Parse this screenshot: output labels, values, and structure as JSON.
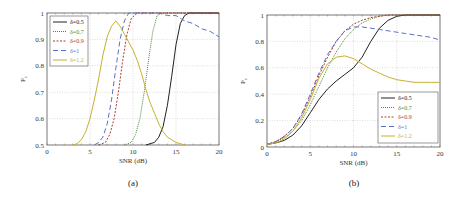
{
  "chart_data": [
    {
      "type": "line",
      "caption": "(a)",
      "xlabel": "SNR (dB)",
      "ylabel": "P_c",
      "xlim": [
        0,
        20
      ],
      "ylim": [
        0.5,
        1
      ],
      "xticks": [
        "0",
        "5",
        "10",
        "15",
        "20"
      ],
      "yticks": [
        "0.5",
        "0.6",
        "0.7",
        "0.8",
        "0.9",
        "1"
      ],
      "grid": true,
      "legend_position": "upper left",
      "series": [
        {
          "name": "δ=0.5",
          "color": "#222222",
          "style": "solid",
          "x": [
            11.5,
            12.5,
            13,
            13.5,
            14,
            14.5,
            15,
            15.5,
            16,
            16.5,
            20
          ],
          "y": [
            0.5,
            0.51,
            0.53,
            0.57,
            0.65,
            0.76,
            0.88,
            0.96,
            0.99,
            1,
            1
          ]
        },
        {
          "name": "δ=0.7",
          "color": "#4a8a3a",
          "style": "dotted",
          "x": [
            9,
            9.8,
            10.3,
            10.8,
            11.3,
            11.8,
            12.3,
            12.8,
            13.3,
            20
          ],
          "y": [
            0.5,
            0.51,
            0.54,
            0.6,
            0.7,
            0.82,
            0.93,
            0.99,
            1,
            1
          ]
        },
        {
          "name": "δ=0.9",
          "color": "#b03a2e",
          "style": "dashed-short",
          "x": [
            6,
            6.8,
            7.3,
            7.8,
            8.3,
            8.8,
            9.3,
            9.8,
            10.5,
            20
          ],
          "y": [
            0.5,
            0.51,
            0.54,
            0.6,
            0.7,
            0.82,
            0.92,
            0.98,
            1,
            1
          ]
        },
        {
          "name": "δ=1",
          "color": "#5a6fc8",
          "style": "dashed-long",
          "x": [
            5.5,
            6,
            6.5,
            7,
            7.5,
            8,
            8.5,
            9,
            9.5,
            10,
            11,
            12,
            13,
            14,
            15,
            16,
            17,
            18,
            19,
            20
          ],
          "y": [
            0.5,
            0.51,
            0.53,
            0.58,
            0.67,
            0.79,
            0.9,
            0.97,
            1,
            1,
            1,
            1,
            1,
            0.99,
            0.99,
            0.97,
            0.96,
            0.94,
            0.93,
            0.91
          ]
        },
        {
          "name": "δ=1.2",
          "color": "#c8b030",
          "style": "solid",
          "x": [
            3,
            3.5,
            4,
            4.5,
            5,
            5.5,
            6,
            6.5,
            7,
            7.5,
            8,
            8.5,
            9,
            9.5,
            10,
            10.5,
            11,
            11.5,
            12,
            12.5,
            13,
            13.5,
            14,
            14.5,
            15,
            15.5,
            16
          ],
          "y": [
            0.5,
            0.505,
            0.52,
            0.55,
            0.6,
            0.67,
            0.75,
            0.84,
            0.91,
            0.95,
            0.97,
            0.95,
            0.92,
            0.89,
            0.86,
            0.82,
            0.77,
            0.71,
            0.66,
            0.62,
            0.58,
            0.55,
            0.53,
            0.52,
            0.51,
            0.505,
            0.5
          ]
        }
      ]
    },
    {
      "type": "line",
      "caption": "(b)",
      "xlabel": "SNR (dB)",
      "ylabel": "P_c",
      "xlim": [
        0,
        20
      ],
      "ylim": [
        0,
        1
      ],
      "xticks": [
        "0",
        "5",
        "10",
        "15",
        "20"
      ],
      "yticks": [
        "0",
        "0.2",
        "0.4",
        "0.6",
        "0.8",
        "1"
      ],
      "grid": true,
      "legend_position": "lower right",
      "series": [
        {
          "name": "δ=0.5",
          "color": "#222222",
          "style": "solid",
          "x": [
            0,
            1,
            2,
            3,
            4,
            5,
            6,
            7,
            8,
            9,
            10,
            11,
            12,
            13,
            14,
            15,
            16,
            17,
            18,
            19,
            20
          ],
          "y": [
            0.02,
            0.03,
            0.05,
            0.09,
            0.16,
            0.26,
            0.36,
            0.44,
            0.5,
            0.55,
            0.6,
            0.68,
            0.8,
            0.9,
            0.96,
            0.99,
            1,
            1,
            1,
            1,
            1
          ]
        },
        {
          "name": "δ=0.7",
          "color": "#4a8a3a",
          "style": "dotted",
          "x": [
            0,
            1,
            2,
            3,
            4,
            5,
            6,
            7,
            8,
            9,
            10,
            11,
            12,
            13,
            14,
            15,
            16,
            17,
            18,
            19,
            20
          ],
          "y": [
            0.02,
            0.04,
            0.07,
            0.12,
            0.2,
            0.32,
            0.46,
            0.6,
            0.72,
            0.82,
            0.89,
            0.94,
            0.97,
            0.99,
            1,
            1,
            1,
            1,
            1,
            1,
            1
          ]
        },
        {
          "name": "δ=0.9",
          "color": "#b03a2e",
          "style": "dashed-short",
          "x": [
            0,
            1,
            2,
            3,
            4,
            5,
            6,
            7,
            8,
            9,
            10,
            11,
            12,
            13,
            14,
            15,
            16,
            17,
            18,
            19,
            20
          ],
          "y": [
            0.02,
            0.04,
            0.08,
            0.14,
            0.24,
            0.38,
            0.54,
            0.68,
            0.8,
            0.88,
            0.93,
            0.96,
            0.98,
            0.99,
            1,
            1,
            1,
            1,
            1,
            1,
            1
          ]
        },
        {
          "name": "δ=1",
          "color": "#5a6fc8",
          "style": "dashed-long",
          "x": [
            0,
            1,
            2,
            3,
            4,
            5,
            6,
            7,
            8,
            9,
            10,
            11,
            12,
            13,
            14,
            15,
            16,
            17,
            18,
            19,
            20
          ],
          "y": [
            0.02,
            0.04,
            0.08,
            0.14,
            0.25,
            0.4,
            0.56,
            0.7,
            0.8,
            0.88,
            0.91,
            0.91,
            0.9,
            0.89,
            0.88,
            0.87,
            0.86,
            0.85,
            0.84,
            0.83,
            0.81
          ]
        },
        {
          "name": "δ=1.2",
          "color": "#c8b030",
          "style": "solid",
          "x": [
            0,
            1,
            2,
            3,
            4,
            5,
            6,
            7,
            8,
            9,
            10,
            11,
            12,
            13,
            14,
            15,
            16,
            17,
            18,
            19,
            20
          ],
          "y": [
            0.02,
            0.03,
            0.06,
            0.12,
            0.22,
            0.36,
            0.52,
            0.63,
            0.68,
            0.69,
            0.67,
            0.63,
            0.59,
            0.56,
            0.53,
            0.51,
            0.5,
            0.49,
            0.49,
            0.49,
            0.49
          ]
        }
      ]
    }
  ]
}
